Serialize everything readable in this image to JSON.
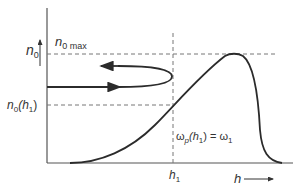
{
  "diagram": {
    "y_axis_label": "n",
    "y_axis_label_sub": "0",
    "n0max_label": "n",
    "n0max_sub": "0 max",
    "n0h1_label_main": "n",
    "n0h1_label_sub": "0",
    "n0h1_label_paren_open": "(h",
    "n0h1_label_paren_sub": "1",
    "n0h1_label_paren_close": ")",
    "annotation_omega": "ω",
    "annotation_omega_sub": "p",
    "annotation_mid": "(h",
    "annotation_mid_sub": "1",
    "annotation_eq": ") = ω",
    "annotation_eq_sub": "1",
    "h1_label": "h",
    "h1_sub": "1",
    "x_axis_label": "h",
    "colors": {
      "curve": "#2b2b2b",
      "axis": "#555555",
      "dashed": "#777777",
      "text": "#333333"
    }
  }
}
